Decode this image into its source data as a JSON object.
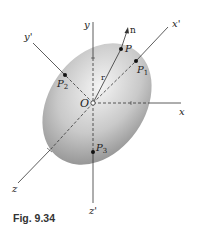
{
  "figure": {
    "caption": "Fig. 9.34",
    "type": "ellipsoid of inertia with principal axes"
  },
  "origin": {
    "label": "O"
  },
  "axes": {
    "x": "x",
    "y": "y",
    "z": "z",
    "x_prime": "x'",
    "y_prime": "y'",
    "z_prime": "z'"
  },
  "vectors": {
    "n": "n",
    "r": "r"
  },
  "points": {
    "P": "P",
    "P1": {
      "base": "P",
      "sub": "1"
    },
    "P2": {
      "base": "P",
      "sub": "2"
    },
    "P3": {
      "base": "P",
      "sub": "3"
    }
  },
  "colors": {
    "ellipsoid_light": "#f2f2f2",
    "ellipsoid_dark": "#8a8a8a",
    "line": "#333333"
  }
}
